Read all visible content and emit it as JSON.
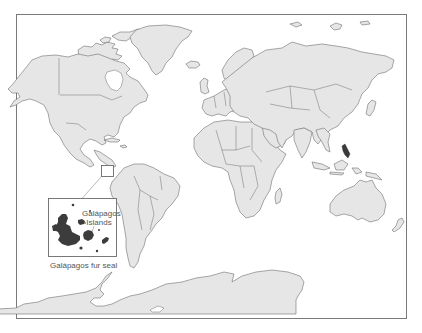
{
  "map": {
    "type": "world political outline map",
    "colors": {
      "background": "#ffffff",
      "land": "#e6e6e6",
      "outline": "#6e6e6e",
      "range_highlight": "#3a3a3a"
    },
    "inset": {
      "title": "Galápagos Islands",
      "title_line1": "Galápagos",
      "title_line2": "Islands",
      "caption": "Galápagos fur seal"
    }
  }
}
